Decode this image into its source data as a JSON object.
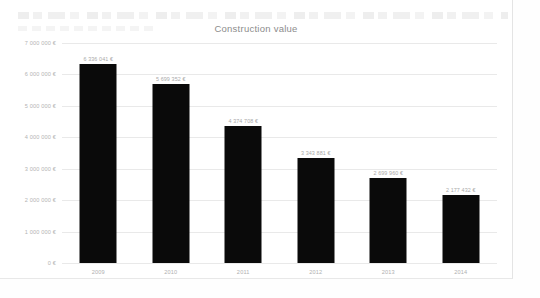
{
  "chart_data": {
    "type": "bar",
    "title": "Construction value",
    "xlabel": "",
    "ylabel": "",
    "categories": [
      "2009",
      "2010",
      "2011",
      "2012",
      "2013",
      "2014"
    ],
    "values": [
      6336041,
      5699352,
      4374708,
      3343881,
      2699960,
      2177432
    ],
    "value_labels": [
      "6 336 041 €",
      "5 699 352 €",
      "4 374 708 €",
      "3 343 881 €",
      "2 699 960 €",
      "2 177 432 €"
    ],
    "ylim": [
      0,
      7000000
    ],
    "ytick_values": [
      7000000,
      6000000,
      5000000,
      4000000,
      3000000,
      2000000,
      1000000,
      0
    ],
    "ytick_labels": [
      "7 000 000 €",
      "6 000 000 €",
      "5 000 000 €",
      "4 000 000 €",
      "3 000 000 €",
      "2 000 000 €",
      "1 000 000 €",
      "0 €"
    ],
    "grid": true,
    "legend": false,
    "bar_color": "#0a0a0a",
    "gridline_color": "#e9e9e9",
    "text_color": "#b0b0b0",
    "title_color": "#8c8c8c"
  }
}
